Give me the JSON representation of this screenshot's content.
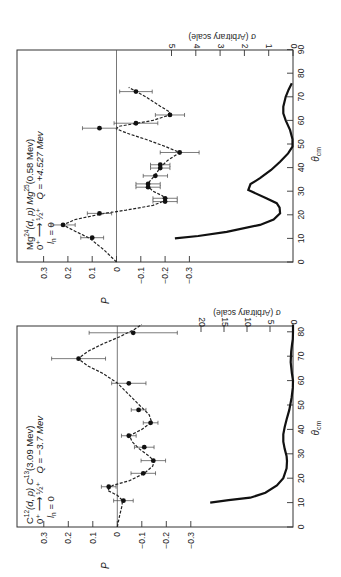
{
  "chart_data": [
    {
      "type": "scatter",
      "panel": "top",
      "title_lines": [
        "Mg24(d, p) Mg25(0.58 Mev)",
        "0+ → ½+   Q = +4.527 Mev",
        "l_n = 0"
      ],
      "reaction": {
        "target": "Mg",
        "target_mass": "24",
        "middle": "(d, p) Mg",
        "product_mass": "25",
        "state": "(0.58 Mev)"
      },
      "transition": "0⁺ ⟶ ½⁺",
      "q_value": "Q = +4.527 Mev",
      "ln": "l",
      "ln_sub": "n",
      "ln_val": " = 0",
      "xlabel": "θ",
      "xlabel_sub": "cm",
      "ylabel": "P",
      "y2label": "σ (Arbitrary scale)",
      "xlim": [
        0,
        90
      ],
      "ylim": [
        -0.38,
        0.38
      ],
      "y2lim": [
        0,
        5.2
      ],
      "x_ticks": [
        0,
        10,
        20,
        30,
        40,
        50,
        60,
        70,
        80,
        90
      ],
      "y_ticks": [
        0.3,
        0.2,
        0.1,
        0,
        -0.1,
        -0.2,
        -0.3
      ],
      "y_tick_labels": [
        "0.3",
        "0.2",
        "0.1",
        "0",
        "−0.1",
        "−0.2",
        "−0.3"
      ],
      "y2_ticks": [
        0,
        1,
        2,
        3,
        4,
        5
      ],
      "polarization_points": [
        {
          "theta": 10.3,
          "P": 0.1,
          "err": 0.047
        },
        {
          "theta": 15.7,
          "P": 0.22,
          "err": 0.05
        },
        {
          "theta": 20.6,
          "P": 0.07,
          "err": 0.05
        },
        {
          "theta": 25.6,
          "P": -0.2,
          "err": 0.05
        },
        {
          "theta": 27.0,
          "P": -0.2,
          "err": 0.05
        },
        {
          "theta": 31.7,
          "P": -0.13,
          "err": 0.05
        },
        {
          "theta": 33.1,
          "P": -0.13,
          "err": 0.05
        },
        {
          "theta": 36.5,
          "P": -0.16,
          "err": 0.05
        },
        {
          "theta": 39.8,
          "P": -0.18,
          "err": 0.04
        },
        {
          "theta": 41.2,
          "P": -0.18,
          "err": 0.04
        },
        {
          "theta": 46.4,
          "P": -0.26,
          "err": 0.08
        },
        {
          "theta": 56.7,
          "P": 0.07,
          "err": 0.07
        },
        {
          "theta": 58.8,
          "P": -0.08,
          "err": 0.09
        },
        {
          "theta": 62.3,
          "P": -0.22,
          "err": 0.06
        },
        {
          "theta": 72.2,
          "P": -0.08,
          "err": 0.067
        }
      ],
      "fit_curve": [
        [
          0,
          0.0
        ],
        [
          5,
          0.05
        ],
        [
          10,
          0.11
        ],
        [
          13,
          0.17
        ],
        [
          15.7,
          0.22
        ],
        [
          18,
          0.17
        ],
        [
          20.6,
          0.05
        ],
        [
          22,
          -0.04
        ],
        [
          24,
          -0.15
        ],
        [
          26,
          -0.2
        ],
        [
          28,
          -0.19
        ],
        [
          30,
          -0.15
        ],
        [
          32,
          -0.13
        ],
        [
          34,
          -0.135
        ],
        [
          37,
          -0.16
        ],
        [
          40,
          -0.18
        ],
        [
          43,
          -0.21
        ],
        [
          46.4,
          -0.26
        ],
        [
          49,
          -0.2
        ],
        [
          52,
          -0.12
        ],
        [
          54,
          -0.06
        ],
        [
          55.5,
          -0.02
        ],
        [
          56.5,
          0.0
        ],
        [
          57.5,
          -0.01
        ],
        [
          58.5,
          -0.07
        ],
        [
          60,
          -0.15
        ],
        [
          62,
          -0.21
        ],
        [
          63.5,
          -0.22
        ],
        [
          66,
          -0.18
        ],
        [
          70,
          -0.12
        ],
        [
          74,
          -0.05
        ]
      ],
      "sigma_curve": [
        [
          10,
          4.86
        ],
        [
          11,
          3.9
        ],
        [
          12.8,
          2.73
        ],
        [
          15.7,
          1.36
        ],
        [
          18,
          0.8
        ],
        [
          20.6,
          0.53
        ],
        [
          23,
          0.55
        ],
        [
          24.9,
          0.67
        ],
        [
          27,
          1.1
        ],
        [
          30.5,
          1.84
        ],
        [
          33,
          1.75
        ],
        [
          35.5,
          1.36
        ],
        [
          39,
          0.9
        ],
        [
          42.5,
          0.53
        ],
        [
          46,
          0.2
        ],
        [
          48.9,
          0.02
        ],
        [
          52,
          0.02
        ],
        [
          55.9,
          0.12
        ],
        [
          60,
          0.3
        ],
        [
          63,
          0.4
        ],
        [
          65.8,
          0.4
        ],
        [
          70,
          0.3
        ],
        [
          73,
          0.18
        ],
        [
          75.7,
          0.05
        ]
      ]
    },
    {
      "type": "scatter",
      "panel": "bottom",
      "reaction": {
        "target": "C",
        "target_mass": "12",
        "middle": "(d, p) C",
        "product_mass": "13",
        "state": "(3.09 Mev)"
      },
      "transition": "0⁺ ⟶ ½⁺",
      "q_value": "Q = −3.7 Mev",
      "ln": "l",
      "ln_sub": "n",
      "ln_val": " = 0",
      "xlabel": "θ",
      "xlabel_sub": "cm",
      "ylabel": "P",
      "y2label": "σ (Arbitrary scale)",
      "xlim": [
        0,
        84
      ],
      "ylim": [
        -0.38,
        0.38
      ],
      "y2lim": [
        0,
        20.5
      ],
      "x_ticks": [
        0,
        10,
        20,
        30,
        40,
        50,
        60,
        70,
        80
      ],
      "y_ticks": [
        0.3,
        0.2,
        0.1,
        0,
        -0.1,
        -0.2,
        -0.3
      ],
      "y_tick_labels": [
        "0.3",
        "0.2",
        "0.1",
        "0",
        "−0.1",
        "−0.2",
        "−0.3"
      ],
      "y2_ticks": [
        0,
        5,
        10,
        15,
        20
      ],
      "polarization_points": [
        {
          "theta": 10.8,
          "P": -0.025,
          "err": 0.04
        },
        {
          "theta": 16.5,
          "P": 0.035,
          "err": 0.03
        },
        {
          "theta": 22.0,
          "P": -0.106,
          "err": 0.05
        },
        {
          "theta": 27.2,
          "P": -0.147,
          "err": 0.05
        },
        {
          "theta": 32.7,
          "P": -0.11,
          "err": 0.04
        },
        {
          "theta": 37.4,
          "P": -0.047,
          "err": 0.03
        },
        {
          "theta": 42.7,
          "P": -0.136,
          "err": 0.03
        },
        {
          "theta": 48.0,
          "P": -0.087,
          "err": 0.03
        },
        {
          "theta": 58.9,
          "P": -0.047,
          "err": 0.07
        },
        {
          "theta": 69.0,
          "P": 0.158,
          "err": 0.11
        },
        {
          "theta": 79.6,
          "P": -0.065,
          "err": 0.18
        }
      ],
      "fit_curve": [
        [
          0,
          0.0
        ],
        [
          5,
          -0.01
        ],
        [
          9,
          -0.02
        ],
        [
          11,
          -0.02
        ],
        [
          13,
          0.0
        ],
        [
          15,
          0.04
        ],
        [
          17,
          0.02
        ],
        [
          19,
          -0.05
        ],
        [
          22,
          -0.11
        ],
        [
          25,
          -0.145
        ],
        [
          27,
          -0.15
        ],
        [
          29,
          -0.13
        ],
        [
          32,
          -0.09
        ],
        [
          35,
          -0.06
        ],
        [
          37.4,
          -0.05
        ],
        [
          40,
          -0.1
        ],
        [
          43,
          -0.14
        ],
        [
          46,
          -0.13
        ],
        [
          50,
          -0.09
        ],
        [
          55,
          -0.04
        ],
        [
          59,
          0.0
        ],
        [
          63,
          0.06
        ],
        [
          66,
          0.12
        ],
        [
          69,
          0.16
        ],
        [
          72,
          0.12
        ],
        [
          75,
          0.06
        ],
        [
          78,
          -0.01
        ],
        [
          81,
          -0.07
        ],
        [
          83,
          -0.1
        ]
      ],
      "sigma_curve": [
        [
          10,
          18.0
        ],
        [
          11,
          14.0
        ],
        [
          12,
          9.3
        ],
        [
          14,
          6.0
        ],
        [
          17,
          3.5
        ],
        [
          20,
          2.1
        ],
        [
          24,
          1.4
        ],
        [
          27,
          1.3
        ],
        [
          29,
          1.4
        ],
        [
          32,
          1.8
        ],
        [
          35,
          2.1
        ],
        [
          38,
          2.1
        ],
        [
          41,
          1.8
        ],
        [
          44,
          1.4
        ],
        [
          48,
          0.8
        ],
        [
          53,
          0.3
        ],
        [
          57,
          0.05
        ],
        [
          60,
          0.0
        ],
        [
          63,
          0.25
        ],
        [
          67.5,
          0.5
        ],
        [
          72,
          0.4
        ],
        [
          75,
          0.2
        ],
        [
          77,
          0.05
        ],
        [
          80,
          0.0
        ],
        [
          83,
          0.0
        ]
      ]
    }
  ],
  "layout_note_rotation": "figure rotated 90° counter-clockwise on page"
}
